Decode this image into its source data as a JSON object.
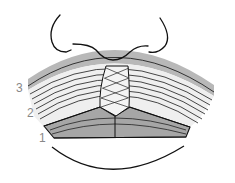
{
  "diagram": {
    "type": "anatomical-illustration",
    "labels": [
      {
        "id": "layer-3",
        "text": "3"
      },
      {
        "id": "layer-2",
        "text": "2"
      },
      {
        "id": "layer-1",
        "text": "1"
      }
    ],
    "colors": {
      "outline": "#111111",
      "band_gray": "#b4b4b4",
      "band_light": "#e6e6e6",
      "lower_gray": "#9a9a9a",
      "label_gray": "#888888"
    }
  }
}
